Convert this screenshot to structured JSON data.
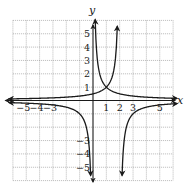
{
  "chart_data": {
    "type": "line",
    "title": "",
    "xlabel": "x",
    "ylabel": "y",
    "xlim": [
      -6,
      6
    ],
    "ylim": [
      -6,
      6
    ],
    "grid": true,
    "legend": null,
    "x_tick_labels": [
      {
        "value": -5,
        "label": "−5"
      },
      {
        "value": -4,
        "label": "−4"
      },
      {
        "value": -3,
        "label": "−3"
      },
      {
        "value": 1,
        "label": "1"
      },
      {
        "value": 2,
        "label": "2"
      },
      {
        "value": 3,
        "label": "3"
      },
      {
        "value": 5,
        "label": "5"
      }
    ],
    "y_tick_labels": [
      {
        "value": 1,
        "label": "1"
      },
      {
        "value": 2,
        "label": "2"
      },
      {
        "value": 3,
        "label": "3"
      },
      {
        "value": 4,
        "label": "4"
      },
      {
        "value": 5,
        "label": "5"
      },
      {
        "value": -3,
        "label": "−3"
      },
      {
        "value": -4,
        "label": "−4"
      },
      {
        "value": -5,
        "label": "−5"
      }
    ],
    "series": [
      {
        "name": "y = 1/x",
        "asymptotes": {
          "x": 0,
          "y": 0
        },
        "points": [
          [
            -6,
            -0.17
          ],
          [
            -3,
            -0.33
          ],
          [
            -1,
            -1
          ],
          [
            -0.5,
            -2
          ],
          [
            -0.2,
            -5
          ],
          [
            0.2,
            5
          ],
          [
            0.5,
            2
          ],
          [
            1,
            1
          ],
          [
            3,
            0.33
          ],
          [
            6,
            0.17
          ]
        ]
      },
      {
        "name": "y = 1/(2-x)",
        "asymptotes": {
          "x": 2,
          "y": 0
        },
        "points": [
          [
            -6,
            0.125
          ],
          [
            -2,
            0.25
          ],
          [
            0,
            0.5
          ],
          [
            1,
            1
          ],
          [
            1.5,
            2
          ],
          [
            1.8,
            5
          ],
          [
            2.2,
            -5
          ],
          [
            2.5,
            -2
          ],
          [
            3,
            -1
          ],
          [
            4,
            -0.5
          ],
          [
            6,
            -0.25
          ]
        ]
      }
    ],
    "annotations": [
      {
        "text": "intersection",
        "x": 1,
        "y": 1
      }
    ]
  },
  "axes": {
    "x_label": "x",
    "y_label": "y"
  }
}
